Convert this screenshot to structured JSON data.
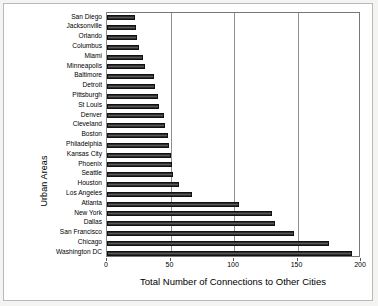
{
  "chart_data": {
    "type": "bar",
    "orientation": "horizontal",
    "title": "",
    "xlabel": "Total Number of Connections to Other Cities",
    "ylabel": "Urban Areas",
    "xlim": [
      0,
      200
    ],
    "xticks": [
      0,
      50,
      100,
      150,
      200
    ],
    "grid": "vertical",
    "legend": "none",
    "categories": [
      "San Diego",
      "Jacksonville",
      "Orlando",
      "Columbus",
      "Miami",
      "Minneapolis",
      "Baltimore",
      "Detroit",
      "Pittsburgh",
      "St Louis",
      "Denver",
      "Cleveland",
      "Boston",
      "Philadelphia",
      "Kansas City",
      "Phoenix",
      "Seattle",
      "Houston",
      "Los Angeles",
      "Atlanta",
      "New York",
      "Dallas",
      "San Francisco",
      "Chicago",
      "Washington DC"
    ],
    "values": [
      22,
      23,
      24,
      25,
      28,
      30,
      37,
      38,
      40,
      41,
      45,
      46,
      48,
      49,
      50,
      51,
      52,
      57,
      67,
      104,
      130,
      132,
      147,
      175,
      193
    ]
  },
  "axis": {
    "x_tick_labels": [
      "0",
      "50",
      "100",
      "150",
      "200"
    ],
    "x_axis_title": "Total Number of Connections to Other Cities",
    "y_axis_title": "Urban Areas"
  },
  "style": {
    "bar_color": "#3a3a3a",
    "bar_edge_color": "#111111",
    "grid_color": "#8f8f8f",
    "plot_background": "#ffffff",
    "page_background": "#f4f4f2"
  }
}
